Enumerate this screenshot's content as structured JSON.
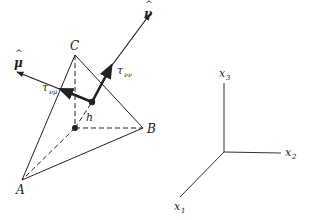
{
  "figure": {
    "tetrahedron": {
      "vertices": {
        "A": {
          "label": "A",
          "x": 22,
          "y": 180
        },
        "B": {
          "label": "B",
          "x": 143,
          "y": 128
        },
        "C": {
          "label": "C",
          "x": 75,
          "y": 55
        }
      },
      "base_point": {
        "x": 75,
        "y": 128
      },
      "face_point": {
        "x": 92,
        "y": 102
      },
      "height_label": "h"
    },
    "vectors": {
      "nu_hat": {
        "label": "ν",
        "hat": "^",
        "stress_label": "τ",
        "stress_sub": "νν"
      },
      "mu_hat": {
        "label": "μ",
        "hat": "^",
        "stress_label": "τ",
        "stress_sub": "νμ"
      }
    },
    "axes": {
      "origin": {
        "x": 224,
        "y": 152
      },
      "x1": {
        "label": "x",
        "sub": "1"
      },
      "x2": {
        "label": "x",
        "sub": "2"
      },
      "x3": {
        "label": "x",
        "sub": "3"
      }
    },
    "colors": {
      "line": "#222222",
      "background": "#ffffff"
    }
  }
}
